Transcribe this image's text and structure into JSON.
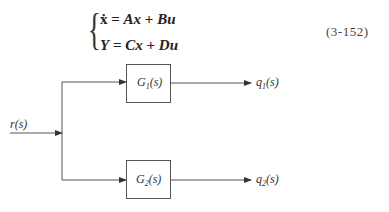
{
  "equation": {
    "line1": {
      "lhs": "ẋ",
      "eq": "=",
      "t1": "Ax",
      "op": "+",
      "t2": "Bu"
    },
    "line2": {
      "lhs": "Y",
      "eq": "=",
      "t1": "Cx",
      "op": "+",
      "t2": "Du"
    },
    "number": "(3-152)"
  },
  "diagram": {
    "input": {
      "label": "r(s)"
    },
    "blocks": [
      {
        "name": "G",
        "sub": "1",
        "arg": "(s)"
      },
      {
        "name": "G",
        "sub": "2",
        "arg": "(s)"
      }
    ],
    "outputs": [
      {
        "name": "q",
        "sub": "1",
        "arg": "(s)"
      },
      {
        "name": "q",
        "sub": "2",
        "arg": "(s)"
      }
    ],
    "line_color": "#444444"
  }
}
